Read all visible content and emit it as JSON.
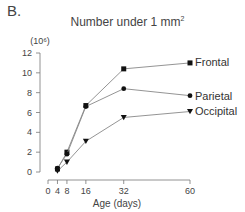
{
  "panel": {
    "label": "B."
  },
  "chart_data": {
    "type": "line",
    "title_main": "Number under 1 mm",
    "title_sup": "2",
    "ylabel": "(10⁶)",
    "xlabel": "Age (days)",
    "x": [
      4,
      8,
      16,
      32,
      60
    ],
    "xticks": [
      0,
      4,
      8,
      16,
      32,
      60
    ],
    "yticks": [
      0,
      2,
      4,
      6,
      8,
      10,
      12
    ],
    "xlim": [
      0,
      60
    ],
    "ylim": [
      0,
      12
    ],
    "grid": false,
    "legend_position": "inline-right",
    "series": [
      {
        "name": "Frontal",
        "marker": "square",
        "values": [
          0.3,
          2.0,
          6.7,
          10.4,
          11.0
        ]
      },
      {
        "name": "Parietal",
        "marker": "circle",
        "values": [
          0.4,
          1.8,
          6.6,
          8.4,
          7.7
        ]
      },
      {
        "name": "Occipital",
        "marker": "triangle-down",
        "values": [
          0.1,
          1.0,
          3.1,
          5.5,
          6.1
        ]
      }
    ],
    "colors": {
      "line": "#888888",
      "marker": "#111111",
      "axis": "#777777"
    }
  }
}
